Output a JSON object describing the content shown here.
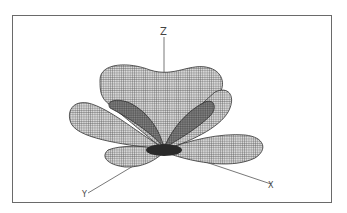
{
  "figure": {
    "type": "3d-wireframe-radiation-pattern",
    "axes": {
      "z_label": "Z",
      "x_label": "X",
      "y_label": "Y"
    },
    "colors": {
      "frame": "#6a6a6a",
      "mesh": "#3a3a3a",
      "background": "#ffffff"
    }
  }
}
